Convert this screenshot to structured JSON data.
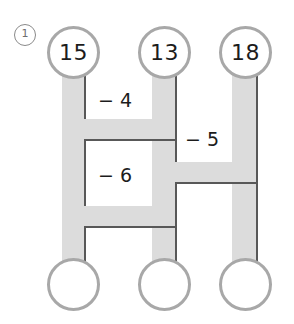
{
  "problem": {
    "number_label": "1",
    "marker_name": "circled-number-one"
  },
  "diagram": {
    "type": "subtraction-pipe-puzzle",
    "colors": {
      "pipe_fill": "#dcdcdc",
      "pipe_stroke": "#585858",
      "node_border": "#a8a8a8",
      "node_fill": "#ffffff",
      "text": "#1c1c1c",
      "marker": "#8a8a8a"
    },
    "top_nodes": [
      {
        "id": "top-left",
        "value": "15"
      },
      {
        "id": "top-middle",
        "value": "13"
      },
      {
        "id": "top-right",
        "value": "18"
      }
    ],
    "bottom_nodes": [
      {
        "id": "bottom-left",
        "value": ""
      },
      {
        "id": "bottom-middle",
        "value": ""
      },
      {
        "id": "bottom-right",
        "value": ""
      }
    ],
    "operations": [
      {
        "id": "op-1",
        "label": "− 4",
        "between": "left-middle",
        "row": "upper"
      },
      {
        "id": "op-2",
        "label": "− 5",
        "between": "middle-right",
        "row": "middle"
      },
      {
        "id": "op-3",
        "label": "− 6",
        "between": "left-middle",
        "row": "lower"
      }
    ]
  }
}
